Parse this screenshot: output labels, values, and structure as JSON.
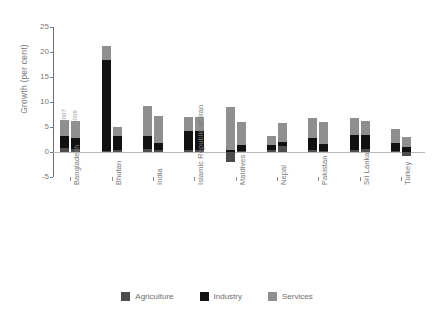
{
  "chart_data": {
    "type": "bar",
    "title": "",
    "subtitle": "",
    "xlabel": "",
    "ylabel": "Growth (per cent)",
    "ylim": [
      -5,
      25
    ],
    "yticks": [
      25,
      20,
      15,
      10,
      5,
      0,
      -5
    ],
    "grid": false,
    "stacked": true,
    "legend_position": "bottom",
    "legend": [
      "Agriculture",
      "Industry",
      "Services"
    ],
    "series_colors": {
      "Agriculture": "#4d4d4d",
      "Industry": "#111111",
      "Services": "#8f8f8f"
    },
    "year_labels": [
      "2007",
      "2008"
    ],
    "categories": [
      "Bangladesh",
      "Bhutan",
      "India",
      "Islamic Republic of Iran",
      "Maldives",
      "Nepal",
      "Pakistan",
      "Sri Lanka",
      "Turkey"
    ],
    "groups": [
      {
        "category": "Bangladesh",
        "bars": [
          {
            "year": "2007",
            "agriculture": 0.8,
            "industry": 2.4,
            "services": 3.3,
            "total": 6.5
          },
          {
            "year": "2008",
            "agriculture": 0.7,
            "industry": 2.2,
            "services": 3.4,
            "total": 6.3
          }
        ]
      },
      {
        "category": "Bhutan",
        "bars": [
          {
            "year": "2007",
            "agriculture": 0.3,
            "industry": 18.2,
            "services": 2.8,
            "total": 21.3
          },
          {
            "year": "2008",
            "agriculture": 0.4,
            "industry": 2.8,
            "services": 1.8,
            "total": 5.0
          }
        ]
      },
      {
        "category": "India",
        "bars": [
          {
            "year": "2007",
            "agriculture": 0.6,
            "industry": 2.6,
            "services": 6.1,
            "total": 9.3
          },
          {
            "year": "2008",
            "agriculture": 0.5,
            "industry": 1.3,
            "services": 5.4,
            "total": 7.2
          }
        ]
      },
      {
        "category": "Islamic Republic of Iran",
        "bars": [
          {
            "year": "2007",
            "agriculture": 0.5,
            "industry": 3.8,
            "services": 2.7,
            "total": 7.0
          },
          {
            "year": "2008",
            "agriculture": 0.4,
            "industry": 3.9,
            "services": 2.7,
            "total": 7.0
          }
        ]
      },
      {
        "category": "Maldives",
        "bars": [
          {
            "year": "2007",
            "agriculture": -2.0,
            "industry": 0.5,
            "services": 8.5,
            "total": 9.0
          },
          {
            "year": "2008",
            "agriculture": 0.3,
            "industry": 1.2,
            "services": 4.5,
            "total": 6.0
          }
        ]
      },
      {
        "category": "Nepal",
        "bars": [
          {
            "year": "2007",
            "agriculture": 0.4,
            "industry": 1.1,
            "services": 1.8,
            "total": 3.3
          },
          {
            "year": "2008",
            "agriculture": 1.3,
            "industry": 0.8,
            "services": 3.7,
            "total": 5.8
          }
        ]
      },
      {
        "category": "Pakistan",
        "bars": [
          {
            "year": "2007",
            "agriculture": 0.4,
            "industry": 2.4,
            "services": 4.0,
            "total": 6.8
          },
          {
            "year": "2008",
            "agriculture": 0.3,
            "industry": 1.4,
            "services": 4.3,
            "total": 6.0
          }
        ]
      },
      {
        "category": "Sri Lanka",
        "bars": [
          {
            "year": "2007",
            "agriculture": 0.5,
            "industry": 2.9,
            "services": 3.4,
            "total": 6.8
          },
          {
            "year": "2008",
            "agriculture": 0.6,
            "industry": 2.8,
            "services": 2.9,
            "total": 6.3
          }
        ]
      },
      {
        "category": "Turkey",
        "bars": [
          {
            "year": "2007",
            "agriculture": 0.2,
            "industry": 1.6,
            "services": 2.9,
            "total": 4.7
          },
          {
            "year": "2008",
            "agriculture": -0.8,
            "industry": 1.0,
            "services": 2.0,
            "total": 3.0
          }
        ]
      }
    ]
  }
}
